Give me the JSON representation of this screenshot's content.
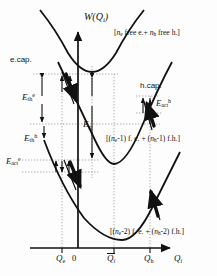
{
  "figure": {
    "type": "configuration-coordinate-diagram",
    "axes": {
      "y_label": "W(Qi)",
      "x_label": "Qi",
      "x_ticks": [
        {
          "name": "Qe",
          "label": "Q",
          "sub": "e",
          "x": 62
        },
        {
          "name": "zero",
          "label": "0",
          "sub": "",
          "x": 78
        },
        {
          "name": "Qi-bar",
          "label": "Q",
          "sub": "i",
          "x": 114,
          "overbar": true
        },
        {
          "name": "Qh",
          "label": "Q",
          "sub": "h",
          "x": 150
        }
      ]
    },
    "curves": [
      {
        "name": "free-carriers",
        "label": "[ne free e.+ nh free h.]",
        "minimum_x": 92,
        "minimum_y": 66
      },
      {
        "name": "one-trapped-pair",
        "label": "[(ne-1) f. e. + (nh-1) f.h.]",
        "minimum_x": 114,
        "minimum_y": 160
      },
      {
        "name": "two-trapped-pairs",
        "label": "[(ne-2) f. e. + (nh-2) f.h.]",
        "minimum_x": 128,
        "minimum_y": 228
      }
    ],
    "annotations": {
      "e_cap": "e.cap.",
      "h_cap": "h.cap.",
      "E_th_e": "Eth e",
      "E_th_h": "Eth h",
      "E_g": "Eg",
      "E_act_e": "Eact e",
      "E_act_h": "Eact h"
    },
    "legend_texts": {
      "top": {
        "pre": "[",
        "n1": "n",
        "s1": "e",
        "mid": " free e.+ ",
        "n2": "n",
        "s2": "h",
        "post": " free h.]"
      },
      "middle": {
        "pre": "[(",
        "n1": "n",
        "s1": "e",
        "mid": "-1) f. e. + (",
        "n2": "n",
        "s2": "h",
        "post": "-1) f.h.]"
      },
      "bottom": {
        "pre": "[(",
        "n1": "n",
        "s1": "e",
        "mid": "-2) f. e. + (",
        "n2": "n",
        "s2": "h",
        "post": "-2) f.h.]"
      }
    },
    "colors": {
      "ink": "#111111",
      "guide": "#9a9a9a",
      "bg": "#fdfdfd"
    }
  }
}
